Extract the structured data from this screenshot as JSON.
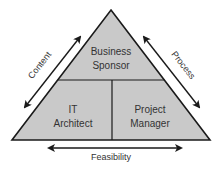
{
  "diagram": {
    "colors": {
      "fill": "#c9c9c9",
      "stroke": "#1a1a1a",
      "text": "#333333",
      "background": "#ffffff"
    },
    "sections": {
      "top": {
        "line1": "Business",
        "line2": "Sponsor"
      },
      "bottom_left": {
        "line1": "IT",
        "line2": "Architect"
      },
      "bottom_right": {
        "line1": "Project",
        "line2": "Manager"
      }
    },
    "axes": {
      "left": "Content",
      "right": "Process",
      "bottom": "Feasibility"
    }
  }
}
